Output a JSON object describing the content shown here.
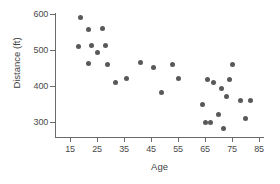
{
  "chart_data": {
    "type": "scatter",
    "title": "",
    "xlabel": "Age",
    "ylabel": "Distance (ft)",
    "xlim": [
      10,
      88
    ],
    "ylim": [
      255,
      615
    ],
    "xticks": [
      15,
      25,
      35,
      45,
      55,
      65,
      75,
      85
    ],
    "yticks": [
      300,
      400,
      500,
      600
    ],
    "xtick_labels": [
      "15",
      "25",
      "35",
      "45",
      "55",
      "65",
      "75",
      "85"
    ],
    "ytick_labels": [
      "300",
      "400",
      "500",
      "600"
    ],
    "grid": false,
    "legend": "none",
    "marker": {
      "shape": "circle",
      "color": "#595959",
      "size_px": 5
    },
    "axis_color": "#6b6b6b",
    "background": "#ffffff",
    "n_points": 29,
    "points": [
      {
        "x": 19,
        "y": 590
      },
      {
        "x": 22,
        "y": 557
      },
      {
        "x": 27,
        "y": 559
      },
      {
        "x": 18,
        "y": 510
      },
      {
        "x": 23,
        "y": 512
      },
      {
        "x": 28,
        "y": 513
      },
      {
        "x": 25,
        "y": 492
      },
      {
        "x": 22,
        "y": 462
      },
      {
        "x": 29,
        "y": 461
      },
      {
        "x": 32,
        "y": 411
      },
      {
        "x": 36,
        "y": 421
      },
      {
        "x": 41,
        "y": 464
      },
      {
        "x": 46,
        "y": 451
      },
      {
        "x": 49,
        "y": 382
      },
      {
        "x": 53,
        "y": 461
      },
      {
        "x": 55,
        "y": 422
      },
      {
        "x": 64,
        "y": 349
      },
      {
        "x": 66,
        "y": 419
      },
      {
        "x": 68,
        "y": 410
      },
      {
        "x": 65,
        "y": 299
      },
      {
        "x": 67,
        "y": 300
      },
      {
        "x": 70,
        "y": 322
      },
      {
        "x": 71,
        "y": 393
      },
      {
        "x": 72,
        "y": 281
      },
      {
        "x": 73,
        "y": 372
      },
      {
        "x": 74,
        "y": 418
      },
      {
        "x": 75,
        "y": 461
      },
      {
        "x": 78,
        "y": 361
      },
      {
        "x": 80,
        "y": 310
      },
      {
        "x": 82,
        "y": 361
      }
    ]
  }
}
